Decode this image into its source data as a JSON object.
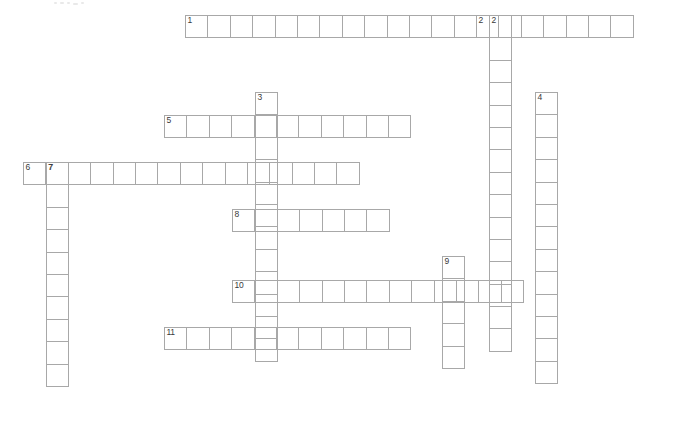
{
  "puzzle": {
    "title": "Crossword puzzle grid",
    "cell_size_px": 23.4,
    "grid_color": "#a8a8a8",
    "background_color": "#ffffff",
    "number_color": "#3a3a3a",
    "canvas": {
      "width": 673,
      "height": 425
    },
    "entry_count": 11,
    "across_count": 6,
    "down_count": 5,
    "entries": [
      {
        "number": "1",
        "direction": "across",
        "length": 20,
        "x": 185,
        "y": 15,
        "numbers_in_word": [
          {
            "index": 0,
            "label": "1"
          },
          {
            "index": 13,
            "label": "2"
          }
        ],
        "letters": []
      },
      {
        "number": "2",
        "direction": "down",
        "length": 15,
        "x": 489,
        "y": 15,
        "numbers_in_word": [
          {
            "index": 0,
            "label": "2"
          }
        ],
        "letters": []
      },
      {
        "number": "3",
        "direction": "down",
        "length": 12,
        "x": 255,
        "y": 92,
        "numbers_in_word": [
          {
            "index": 0,
            "label": "3"
          }
        ],
        "letters": []
      },
      {
        "number": "4",
        "direction": "down",
        "length": 13,
        "x": 535,
        "y": 92,
        "numbers_in_word": [
          {
            "index": 0,
            "label": "4"
          }
        ],
        "letters": []
      },
      {
        "number": "5",
        "direction": "across",
        "length": 11,
        "x": 164,
        "y": 115,
        "numbers_in_word": [
          {
            "index": 0,
            "label": "5"
          }
        ],
        "letters": []
      },
      {
        "number": "6",
        "direction": "across",
        "length": 15,
        "x": 23,
        "y": 162,
        "numbers_in_word": [
          {
            "index": 0,
            "label": "6"
          },
          {
            "index": 1,
            "label": "7"
          }
        ],
        "letters": []
      },
      {
        "number": "7",
        "direction": "down",
        "length": 10,
        "x": 46,
        "y": 162,
        "numbers_in_word": [
          {
            "index": 0,
            "label": "7"
          }
        ],
        "letters": []
      },
      {
        "number": "8",
        "direction": "across",
        "length": 7,
        "x": 232,
        "y": 209,
        "numbers_in_word": [
          {
            "index": 0,
            "label": "8"
          }
        ],
        "letters": []
      },
      {
        "number": "9",
        "direction": "down",
        "length": 5,
        "x": 442,
        "y": 256,
        "numbers_in_word": [
          {
            "index": 0,
            "label": "9"
          }
        ],
        "letters": []
      },
      {
        "number": "10",
        "direction": "across",
        "length": 13,
        "x": 232,
        "y": 280,
        "numbers_in_word": [
          {
            "index": 0,
            "label": "10"
          }
        ],
        "letters": []
      },
      {
        "number": "11",
        "direction": "across",
        "length": 11,
        "x": 164,
        "y": 327,
        "numbers_in_word": [
          {
            "index": 0,
            "label": "11"
          }
        ],
        "letters": []
      }
    ],
    "scan_specks": [
      {
        "x": 54,
        "y": 2,
        "w": 3,
        "h": 2
      },
      {
        "x": 60,
        "y": 2,
        "w": 4,
        "h": 2
      },
      {
        "x": 67,
        "y": 2,
        "w": 3,
        "h": 2
      },
      {
        "x": 73,
        "y": 3,
        "w": 5,
        "h": 2
      },
      {
        "x": 81,
        "y": 2,
        "w": 3,
        "h": 2
      }
    ]
  }
}
